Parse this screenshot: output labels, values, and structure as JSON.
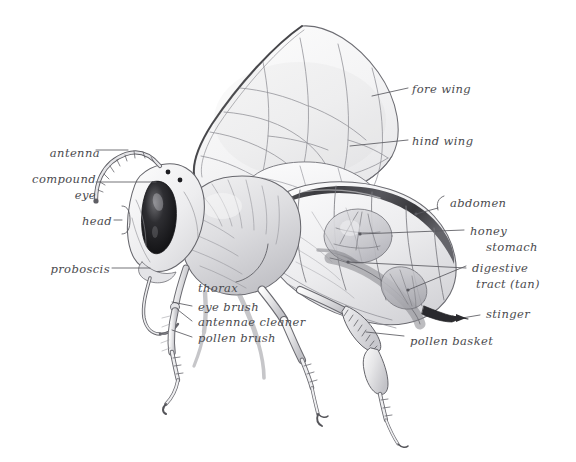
{
  "figure": {
    "style": "pencil sketch cutaway illustration",
    "background_color": "#ffffff",
    "ink_color": "#4a4a4e"
  },
  "labels": [
    {
      "id": "antenna",
      "text": "antenna",
      "x": 48,
      "y": 152,
      "align": "right"
    },
    {
      "id": "compound-eye",
      "text": "compound",
      "text2": "eye",
      "x": 30,
      "y": 177,
      "align": "right"
    },
    {
      "id": "head",
      "text": "head",
      "x": 88,
      "y": 218,
      "align": "right"
    },
    {
      "id": "proboscis",
      "text": "proboscis",
      "x": 55,
      "y": 265,
      "align": "right"
    },
    {
      "id": "thorax",
      "text": "thorax",
      "x": 196,
      "y": 286,
      "align": "left"
    },
    {
      "id": "eye-brush",
      "text": "eye brush",
      "x": 196,
      "y": 309,
      "align": "left"
    },
    {
      "id": "antennae-cleaner",
      "text": "antennae cleaner",
      "x": 196,
      "y": 324,
      "align": "left"
    },
    {
      "id": "pollen-brush",
      "text": "pollen brush",
      "x": 196,
      "y": 340,
      "align": "left"
    },
    {
      "id": "fore-wing",
      "text": "fore wing",
      "x": 412,
      "y": 82,
      "align": "left"
    },
    {
      "id": "hind-wing",
      "text": "hind wing",
      "x": 412,
      "y": 134,
      "align": "left"
    },
    {
      "id": "abdomen",
      "text": "abdomen",
      "x": 448,
      "y": 202,
      "align": "left"
    },
    {
      "id": "honey-stomach",
      "text": "honey",
      "text2": "stomach",
      "x": 468,
      "y": 230,
      "align": "left"
    },
    {
      "id": "digestive-tract",
      "text": "digestive",
      "text2": "tract (tan)",
      "x": 470,
      "y": 267,
      "align": "left"
    },
    {
      "id": "stinger",
      "text": "stinger",
      "x": 484,
      "y": 312,
      "align": "left"
    },
    {
      "id": "pollen-basket",
      "text": "pollen basket",
      "x": 408,
      "y": 339,
      "align": "left"
    }
  ],
  "parts": [
    "antenna",
    "compound eye",
    "head",
    "proboscis",
    "thorax",
    "eye brush",
    "antennae cleaner",
    "pollen brush",
    "fore wing",
    "hind wing",
    "abdomen",
    "honey stomach",
    "digestive tract (tan)",
    "stinger",
    "pollen basket"
  ]
}
